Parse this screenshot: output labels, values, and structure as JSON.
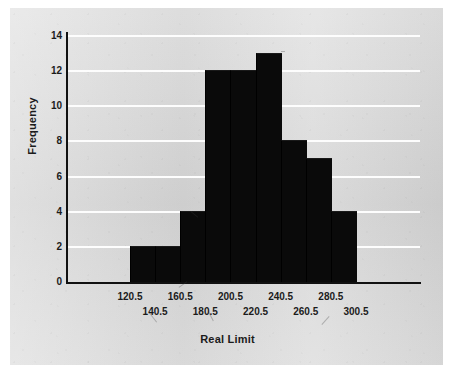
{
  "chart_data": {
    "type": "bar",
    "title": "",
    "xlabel": "Real Limit",
    "ylabel": "Frequency",
    "categories": [
      "120.5",
      "140.5",
      "160.5",
      "180.5",
      "200.5",
      "220.5",
      "240.5",
      "260.5",
      "280.5"
    ],
    "bin_edges": [
      "120.5",
      "140.5",
      "160.5",
      "180.5",
      "200.5",
      "220.5",
      "240.5",
      "260.5",
      "280.5",
      "300.5"
    ],
    "values": [
      2,
      2,
      4,
      12,
      12,
      13,
      8,
      7,
      4
    ],
    "ylim": [
      0,
      14
    ],
    "ytick_labels": [
      "0",
      "2",
      "4",
      "6",
      "8",
      "10",
      "12",
      "14"
    ],
    "ytick_values": [
      0,
      2,
      4,
      6,
      8,
      10,
      12,
      14
    ],
    "xtick_labels_row_top": [
      "120.5",
      "160.5",
      "200.5",
      "240.5",
      "280.5"
    ],
    "xtick_labels_row_bottom": [
      "140.5",
      "180.5",
      "220.5",
      "260.5",
      "300.5"
    ],
    "grid": "horizontal",
    "legend": "none",
    "bar_color": "#0a0a0a",
    "plot_background": "#d9d9d9",
    "gridline_color": "#fdfdfd",
    "axis_color": "#111111"
  },
  "axes": {
    "x_title": "Real Limit",
    "y_title": "Frequency"
  }
}
